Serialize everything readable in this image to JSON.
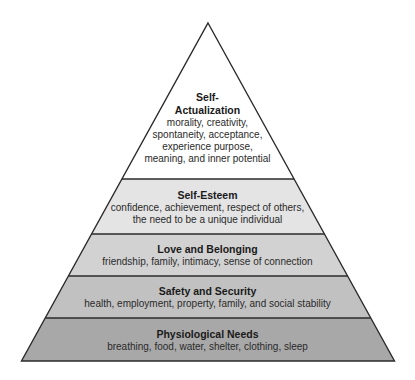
{
  "diagram": {
    "type": "pyramid",
    "colors": {
      "outline": "#2b2b2b",
      "level5": "#ffffff",
      "level4": "#e4e4e4",
      "level3": "#d2d2d2",
      "level2": "#c1c1c1",
      "level1": "#a8a8a8"
    },
    "levels": [
      {
        "id": "self-actualization",
        "title_line1": "Self-",
        "title_line2": "Actualization",
        "desc_lines": [
          "morality, creativity,",
          "spontaneity, acceptance,",
          "experience purpose,",
          "meaning, and inner potential"
        ]
      },
      {
        "id": "self-esteem",
        "title": "Self-Esteem",
        "desc_lines": [
          "confidence, achievement, respect of others,",
          "the need to be a unique individual"
        ]
      },
      {
        "id": "love-belonging",
        "title": "Love and Belonging",
        "desc_lines": [
          "friendship, family, intimacy, sense of connection"
        ]
      },
      {
        "id": "safety-security",
        "title": "Safety and Security",
        "desc_lines": [
          "health, employment, property, family, and social stability"
        ]
      },
      {
        "id": "physiological",
        "title": "Physiological Needs",
        "desc_lines": [
          "breathing, food, water, shelter, clothing, sleep"
        ]
      }
    ]
  }
}
